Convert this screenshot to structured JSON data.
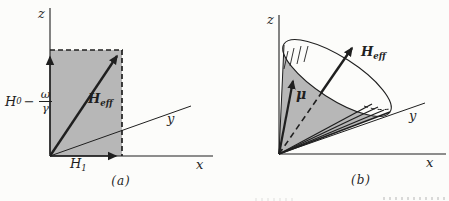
{
  "figure": {
    "panels": [
      {
        "caption": "(a)",
        "axis_labels": {
          "x": "x",
          "y": "y",
          "z": "z"
        },
        "vector_labels": {
          "h_eff_base": "H",
          "h_eff_sub": "eff",
          "h1_base": "H",
          "h1_sub": "1"
        },
        "z_component_expression": {
          "symbol": "H",
          "symbol_sub": "0",
          "operator": "−",
          "fraction_numerator": "ω",
          "fraction_denominator": "γ"
        }
      },
      {
        "caption": "(b)",
        "axis_labels": {
          "x": "x",
          "y": "y",
          "z": "z"
        },
        "vector_labels": {
          "h_eff_base": "H",
          "h_eff_sub": "eff",
          "mu": "μ"
        }
      }
    ]
  },
  "colors": {
    "ink": "#1f1f1f",
    "shade": "#b7b7b7",
    "paper": "#fcfcfa"
  }
}
